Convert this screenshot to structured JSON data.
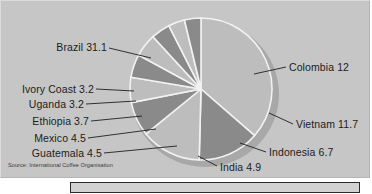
{
  "chart_data": {
    "type": "pie",
    "title": "",
    "source": "Source: International Coffee Organisation",
    "unit_note": "",
    "categories": [
      "Brazil",
      "Colombia",
      "Vietnam",
      "Indonesia",
      "India",
      "Guatemala",
      "Mexico",
      "Ethiopia",
      "Uganda",
      "Ivory Coast"
    ],
    "values": [
      31.1,
      12,
      11.7,
      6.7,
      4.9,
      4.5,
      4.5,
      3.7,
      3.2,
      3.2
    ],
    "labels": [
      "Brazil 31.1",
      "Colombia 12",
      "Vietnam 11.7",
      "Indonesia 6.7",
      "India 4.9",
      "Guatemala 4.5",
      "Mexico 4.5",
      "Ethiopia 3.7",
      "Uganda 3.2",
      "Ivory Coast 3.2"
    ],
    "legend_position": "callout-labels",
    "grid": false,
    "colors": {
      "background": "#c6c6c6",
      "slice_light": "#bdbdbd",
      "slice_dark": "#8a8a8a",
      "slice_outline": "#f0f0f0",
      "shadow": "#a6a6a6",
      "text": "#1c1c1c"
    },
    "slices": [
      {
        "label": "Brazil 31.1",
        "value": 31.1,
        "tone": "light"
      },
      {
        "label": "Colombia 12",
        "value": 12,
        "tone": "dark"
      },
      {
        "label": "Vietnam 11.7",
        "value": 11.7,
        "tone": "light"
      },
      {
        "label": "Indonesia 6.7",
        "value": 6.7,
        "tone": "dark"
      },
      {
        "label": "India 4.9",
        "value": 4.9,
        "tone": "light"
      },
      {
        "label": "Guatemala 4.5",
        "value": 4.5,
        "tone": "dark"
      },
      {
        "label": "Mexico 4.5",
        "value": 4.5,
        "tone": "light"
      },
      {
        "label": "Ethiopia 3.7",
        "value": 3.7,
        "tone": "dark"
      },
      {
        "label": "Uganda 3.2",
        "value": 3.2,
        "tone": "light"
      },
      {
        "label": "Ivory Coast 3.2",
        "value": 3.2,
        "tone": "dark"
      }
    ]
  },
  "caption": {
    "text": ""
  }
}
